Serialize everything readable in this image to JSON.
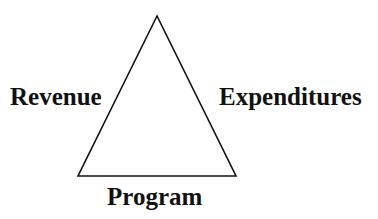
{
  "diagram": {
    "type": "triangle",
    "stroke_color": "#111111",
    "vertices": {
      "apex": [
        157,
        16
      ],
      "bottom_left": [
        78,
        176
      ],
      "bottom_right": [
        236,
        176
      ]
    },
    "labels": {
      "left": "Revenue",
      "right": "Expenditures",
      "bottom": "Program"
    }
  }
}
